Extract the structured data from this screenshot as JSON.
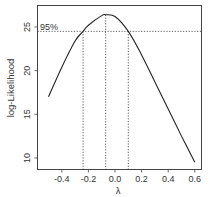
{
  "chart_data": {
    "type": "line",
    "title": "",
    "xlabel": "λ",
    "ylabel": "log-Likelihood",
    "xlim": [
      -0.54,
      0.63
    ],
    "ylim": [
      8.6,
      27.5
    ],
    "grid": false,
    "legend": null,
    "x_ticks": [
      -0.4,
      -0.2,
      0.0,
      0.2,
      0.4,
      0.6
    ],
    "x_tick_labels": [
      "-0.4",
      "-0.2",
      "0.0",
      "0.2",
      "0.4",
      "0.6"
    ],
    "y_ticks": [
      10,
      15,
      20,
      25
    ],
    "y_tick_labels": [
      "10",
      "15",
      "20",
      "25"
    ],
    "series": [
      {
        "name": "profile log-likelihood",
        "x": [
          -0.5,
          -0.4,
          -0.3,
          -0.24,
          -0.2,
          -0.1,
          -0.07,
          0.0,
          0.1,
          0.2,
          0.3,
          0.4,
          0.5,
          0.6
        ],
        "y": [
          17.0,
          20.4,
          23.4,
          24.5,
          25.2,
          26.3,
          26.4,
          26.2,
          24.5,
          21.8,
          18.7,
          15.6,
          12.5,
          9.5
        ]
      }
    ],
    "annotations": [
      {
        "type": "hline",
        "y": 24.5,
        "style": "dotted",
        "label": "95%"
      },
      {
        "type": "vline",
        "x": -0.24,
        "style": "dotted",
        "label": "lower CI"
      },
      {
        "type": "vline",
        "x": -0.07,
        "style": "dotted",
        "label": "MLE"
      },
      {
        "type": "vline",
        "x": 0.1,
        "style": "dotted",
        "label": "upper CI"
      }
    ],
    "ci_label": "95%"
  },
  "labels": {
    "xlabel": "λ",
    "ylabel": "log-Likelihood",
    "ci": "95%"
  }
}
